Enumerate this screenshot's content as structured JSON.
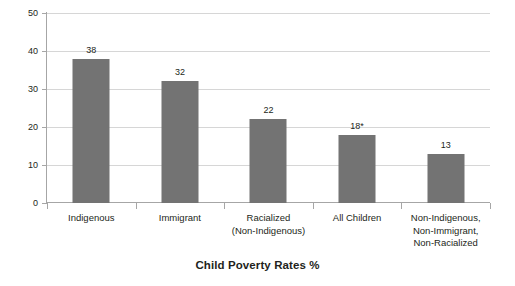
{
  "chart_data": {
    "type": "bar",
    "title": "Child Poverty Rates %",
    "xlabel": "",
    "ylabel": "",
    "ylim": [
      0,
      50
    ],
    "yticks": [
      0,
      10,
      20,
      30,
      40,
      50
    ],
    "ytick_labels": [
      "0",
      "10",
      "20",
      "30",
      "40",
      "50"
    ],
    "grid": "horizontal",
    "legend": "none",
    "bar_color": "#737373",
    "gridline_color": "#d6d6d6",
    "axis_color": "#a6a6a6",
    "categories": [
      "Indigenous",
      "Immigrant",
      "Racialized (Non-Indigenous)",
      "All Children",
      "Non-Indigenous, Non-Immigrant, Non-Racialized"
    ],
    "category_lines": [
      [
        "Indigenous"
      ],
      [
        "Immigrant"
      ],
      [
        "Racialized",
        "(Non-Indigenous)"
      ],
      [
        "All Children"
      ],
      [
        "Non-Indigenous,",
        "Non-Immigrant,",
        "Non-Racialized"
      ]
    ],
    "values": [
      38,
      32,
      22,
      18,
      13
    ],
    "data_labels": [
      "38",
      "32",
      "22",
      "18*",
      "13"
    ],
    "annotations": [
      "* asterisk on All Children value"
    ]
  }
}
